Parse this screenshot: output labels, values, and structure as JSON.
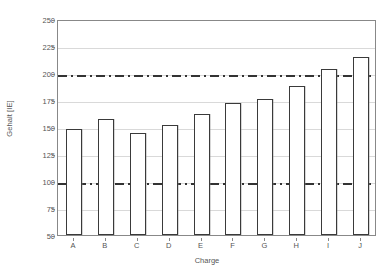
{
  "chart_data": {
    "type": "bar",
    "title": "",
    "xlabel": "Charge",
    "ylabel": "Gehalt [IE]",
    "categories": [
      "A",
      "B",
      "C",
      "D",
      "E",
      "F",
      "G",
      "H",
      "I",
      "J"
    ],
    "values": [
      148,
      157,
      144,
      152,
      162,
      172,
      176,
      188,
      204,
      215
    ],
    "ylim": [
      50,
      250
    ],
    "yticks": [
      50,
      75,
      100,
      125,
      150,
      175,
      200,
      225,
      250
    ],
    "ytick_labels": [
      "50",
      "75",
      "100",
      "125",
      "150",
      "175",
      "200",
      "225",
      "250"
    ],
    "grid": true,
    "legend": "none",
    "reference_lines": [
      {
        "value": 100,
        "style": "dash-dot",
        "color": "#333333"
      },
      {
        "value": 200,
        "style": "dash-dot",
        "color": "#333333"
      }
    ],
    "colors": {
      "bar_fill": "#ffffff",
      "bar_edge": "#3a3a3a",
      "grid": "#d9d9d9",
      "axis": "#888888",
      "text": "#555555",
      "background": "#ffffff"
    }
  }
}
